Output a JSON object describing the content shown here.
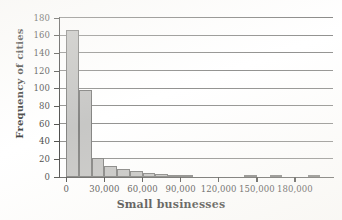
{
  "chart_data": {
    "type": "bar",
    "title": "",
    "xlabel": "Small businesses",
    "ylabel": "Frequency of cities",
    "xlim": [
      -5000,
      210000
    ],
    "ylim": [
      0,
      180
    ],
    "grid": "horizontal",
    "legend": "none",
    "bin_width": 10000,
    "x_tick_labels": [
      "0",
      "30,000",
      "60,000",
      "90,000",
      "120,000",
      "150,000",
      "180,000"
    ],
    "x_tick_values": [
      0,
      30000,
      60000,
      90000,
      120000,
      150000,
      180000
    ],
    "y_tick_labels": [
      "0",
      "20",
      "40",
      "60",
      "80",
      "100",
      "120",
      "140",
      "160",
      "180"
    ],
    "y_tick_values": [
      0,
      20,
      40,
      60,
      80,
      100,
      120,
      140,
      160,
      180
    ],
    "bin_starts": [
      0,
      10000,
      20000,
      30000,
      40000,
      50000,
      60000,
      70000,
      80000,
      90000,
      100000,
      110000,
      120000,
      130000,
      140000,
      150000,
      160000,
      170000,
      180000,
      190000
    ],
    "values": [
      166,
      98,
      22,
      12,
      9,
      7,
      4,
      3,
      2,
      1,
      0,
      0,
      0,
      0,
      1,
      0,
      1,
      0,
      0,
      1
    ],
    "bar_fill_color": "#bdbdbb",
    "bar_edge_color": "#6e6e6c",
    "grid_color": "#5b5b58",
    "axis_color": "#2f2f2e",
    "text_color": "#1d1d1b"
  }
}
